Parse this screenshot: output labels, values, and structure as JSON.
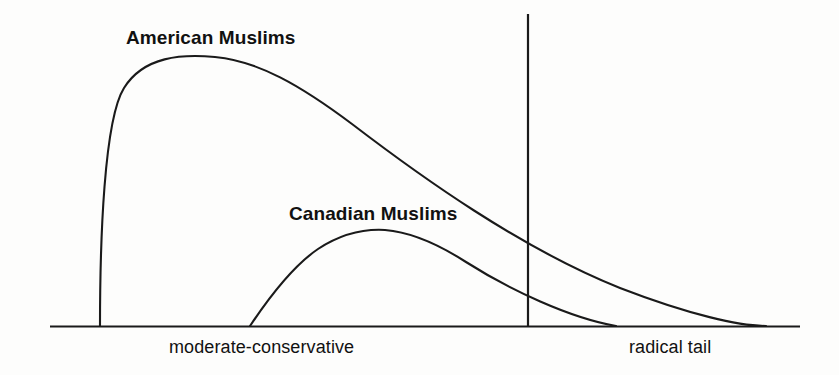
{
  "figure": {
    "background_color": "#fdfdfc",
    "ink_color": "#1a1a1a",
    "width": 839,
    "height": 375
  },
  "labels": {
    "american": "American Muslims",
    "canadian": "Canadian Muslims",
    "axis_left": "moderate-conservative",
    "axis_right": "radical tail"
  },
  "chart_data": {
    "type": "line",
    "title": "",
    "subtitle": "",
    "xlabel": "",
    "ylabel": "",
    "grid": false,
    "legend_position": "inline-annotation",
    "axis": {
      "baseline_y_px": 326,
      "baseline_x_start_px": 50,
      "baseline_x_end_px": 800,
      "x_axis_visible": true,
      "y_axis_visible": false,
      "tick_labels": [
        "moderate-conservative",
        "radical tail"
      ],
      "tick_label_positions_px": [
        169,
        629
      ]
    },
    "annotations": [
      {
        "text": "American Muslims",
        "x_px": 126,
        "y_px": 27,
        "bold": true,
        "describes": "american"
      },
      {
        "text": "Canadian Muslims",
        "x_px": 289,
        "y_px": 203,
        "bold": true,
        "describes": "canadian"
      }
    ],
    "reference_lines": [
      {
        "name": "radical-threshold",
        "orientation": "vertical",
        "x_px": 528,
        "y_top_px": 14,
        "y_bottom_px": 327
      }
    ],
    "series": [
      {
        "name": "American Muslims",
        "description": "Sharply rising left edge, high broad peak, long slowly-decaying right tail extending past the radical-threshold line to the far right of the axis.",
        "color": "#1a1a1a",
        "onset_x_px": 100,
        "peak_x_px": 215,
        "peak_y_px": 57,
        "peak_height_px": 269,
        "crosses_threshold_y_px": 192,
        "end_x_px": 766,
        "path": "M 100,326 C 100,240 104,120 124,88 C 144,56 182,54 215,57 C 258,61 300,85 352,124 C 420,176 520,248 620,288 C 690,315 740,326 766,326"
      },
      {
        "name": "Canadian Muslims",
        "description": "Later onset, much lower and broader peak, shorter right tail that reaches the axis well before the far right edge.",
        "color": "#1a1a1a",
        "onset_x_px": 250,
        "peak_x_px": 385,
        "peak_y_px": 230,
        "peak_height_px": 96,
        "crosses_threshold_y_px": 281,
        "end_x_px": 616,
        "path": "M 250,326 C 262,308 290,268 318,249 C 344,232 368,229 385,230 C 410,232 438,244 466,262 C 510,290 570,318 616,326"
      }
    ]
  }
}
